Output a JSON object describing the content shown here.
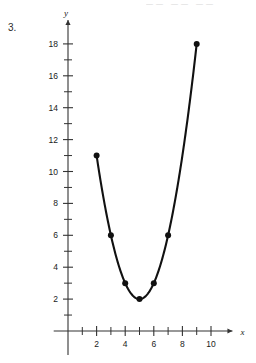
{
  "page": {
    "problem_number": "3.",
    "top_cut_text": "——  ——       ——"
  },
  "chart_data": {
    "type": "scatter",
    "title": "",
    "subtitle": "",
    "xlabel": "x",
    "ylabel": "y",
    "xlim": [
      -1,
      11.5
    ],
    "ylim": [
      -1.5,
      19.5
    ],
    "grid": false,
    "legend": null,
    "x_major_ticks": [
      2,
      4,
      6,
      8,
      10
    ],
    "x_minor_ticks": [
      1,
      3,
      5,
      7,
      9
    ],
    "x_tick_labels": [
      "2",
      "4",
      "6",
      "8",
      "10"
    ],
    "y_major_ticks": [
      2,
      4,
      6,
      8,
      10,
      12,
      14,
      16,
      18
    ],
    "y_minor_ticks": [
      1,
      3,
      5,
      7,
      9,
      11,
      13,
      15,
      17
    ],
    "y_tick_labels": [
      "2",
      "4",
      "6",
      "8",
      "10",
      "12",
      "14",
      "16",
      "18"
    ],
    "points": [
      {
        "x": 2,
        "y": 11
      },
      {
        "x": 3,
        "y": 6
      },
      {
        "x": 4,
        "y": 3
      },
      {
        "x": 5,
        "y": 2
      },
      {
        "x": 6,
        "y": 3
      },
      {
        "x": 7,
        "y": 6
      },
      {
        "x": 9,
        "y": 18
      }
    ],
    "curve": {
      "kind": "parabola",
      "equation": "y = (x - 5)^2 + 2",
      "vertex": [
        5,
        2
      ],
      "x_start": 2,
      "x_end": 9,
      "color": "#111111",
      "width": 2.1
    },
    "marker": {
      "shape": "circle",
      "radius": 3,
      "color": "#111111"
    },
    "axis_color": "#333333"
  }
}
